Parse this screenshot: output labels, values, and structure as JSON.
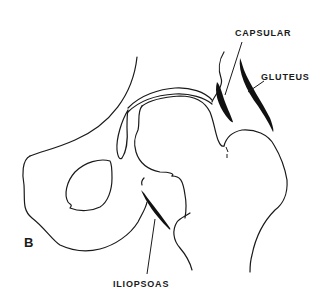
{
  "figure": {
    "panel_label": "B",
    "labels": {
      "capsular": "CAPSULAR",
      "gluteus": "GLUTEUS",
      "iliopsoas": "ILIOPSOAS"
    },
    "colors": {
      "line": "#1a1a1a",
      "muscle": "#111111",
      "background": "#ffffff"
    }
  }
}
